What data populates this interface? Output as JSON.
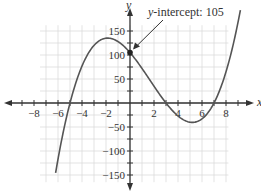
{
  "chart_data": {
    "type": "line",
    "title": "",
    "xlabel": "x",
    "ylabel": "y",
    "xlim": [
      -10,
      10
    ],
    "ylim": [
      -175,
      175
    ],
    "grid": true,
    "x_ticks": [
      -8,
      -6,
      -4,
      -2,
      2,
      4,
      6,
      8
    ],
    "x_tick_labels": [
      "−8",
      "−6",
      "−4",
      "−2",
      "2",
      "4",
      "6",
      "8"
    ],
    "y_ticks": [
      150,
      100,
      50,
      -50,
      -100,
      -150
    ],
    "y_tick_labels": [
      "150",
      "100",
      "50",
      "−50",
      "−100",
      "−150"
    ],
    "series": [
      {
        "name": "f(x) = (x+5)(x−3)(x−7)",
        "x_range": [
          -6.2,
          9.2
        ],
        "x": [
          -6,
          -5,
          -4,
          -3,
          -2,
          -1,
          0,
          1,
          2,
          3,
          4,
          5,
          6,
          7,
          8,
          9
        ],
        "values": [
          -117,
          0,
          77,
          120,
          135,
          128,
          105,
          72,
          35,
          0,
          -27,
          -40,
          -33,
          0,
          65,
          168
        ],
        "color": "#555555"
      }
    ],
    "annotations": [
      {
        "text": "y-intercept: 105",
        "italic_prefix": "y",
        "suffix": "-intercept: 105",
        "point": [
          0,
          105
        ]
      }
    ],
    "x_intercepts": [
      -5,
      3,
      7
    ],
    "y_intercept": 105
  }
}
